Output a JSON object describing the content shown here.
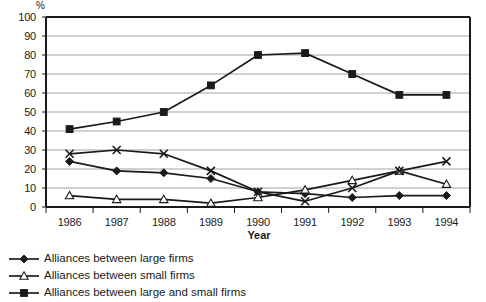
{
  "chart_data": {
    "type": "line",
    "title": "",
    "xlabel": "Year",
    "ylabel": "%",
    "categories": [
      "1986",
      "1987",
      "1988",
      "1989",
      "1990",
      "1991",
      "1992",
      "1993",
      "1994"
    ],
    "x": [
      1986,
      1987,
      1988,
      1989,
      1990,
      1991,
      1992,
      1993,
      1994
    ],
    "ylim": [
      0,
      100
    ],
    "yticks": [
      0,
      10,
      20,
      30,
      40,
      50,
      60,
      70,
      80,
      90,
      100
    ],
    "grid": true,
    "legend_position": "below-left",
    "series": [
      {
        "name": "Alliances between large firms",
        "marker": "filled-diamond",
        "color": "#1a1a1a",
        "values": [
          24,
          19,
          18,
          15,
          8,
          7,
          5,
          6,
          6
        ]
      },
      {
        "name": "Alliances between small firms",
        "marker": "open-triangle",
        "color": "#1a1a1a",
        "values": [
          6,
          4,
          4,
          2,
          5,
          9,
          14,
          19,
          12
        ]
      },
      {
        "name": "Alliances between large and small firms",
        "marker": "filled-square",
        "color": "#1a1a1a",
        "values": [
          41,
          45,
          50,
          64,
          80,
          81,
          70,
          59,
          59
        ]
      },
      {
        "name": "",
        "marker": "cross",
        "color": "#1a1a1a",
        "values": [
          28,
          30,
          28,
          19,
          8,
          3,
          10,
          19,
          24
        ]
      }
    ]
  },
  "axes": {
    "ytick_labels": [
      "100",
      "90",
      "80",
      "70",
      "60",
      "50",
      "40",
      "30",
      "20",
      "10",
      "0"
    ],
    "xtick_labels": [
      "1986",
      "1987",
      "1988",
      "1989",
      "1990",
      "1991",
      "1992",
      "1993",
      "1994"
    ],
    "unit_label": "%",
    "xaxis_title": "Year"
  },
  "legend": {
    "items": [
      {
        "label": "Alliances between large firms",
        "marker": "filled-diamond"
      },
      {
        "label": "Alliances between small firms",
        "marker": "open-triangle"
      },
      {
        "label": "Alliances between large and small firms",
        "marker": "filled-square"
      }
    ]
  }
}
